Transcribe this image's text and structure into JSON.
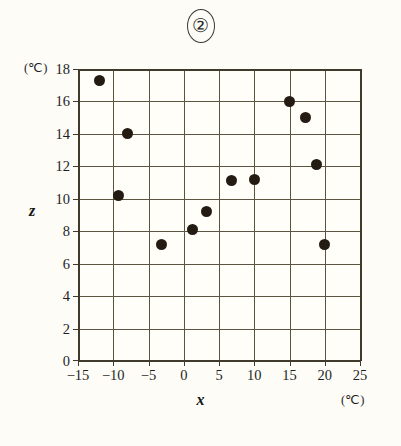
{
  "chart_data": {
    "type": "scatter",
    "title": "②",
    "xlabel": "x",
    "ylabel": "z",
    "x_unit": "(℃)",
    "y_unit": "(℃)",
    "xlim": [
      -15,
      25
    ],
    "ylim": [
      0,
      18
    ],
    "x_ticks": [
      -15,
      -10,
      -5,
      0,
      5,
      10,
      15,
      20,
      25
    ],
    "x_tick_labels": [
      "−15",
      "−10",
      "−5",
      "0",
      "5",
      "10",
      "15",
      "20",
      "25"
    ],
    "y_ticks": [
      0,
      2,
      4,
      6,
      8,
      10,
      12,
      14,
      16,
      18
    ],
    "y_tick_labels": [
      "0",
      "2",
      "4",
      "6",
      "8",
      "10",
      "12",
      "14",
      "16",
      "18"
    ],
    "grid": true,
    "legend": "none",
    "marker_color": "#241c12",
    "grid_color": "#5a5440",
    "frame_color": "#3f3a2c",
    "background_color": "#fdfcf7",
    "points": [
      {
        "x": -12.0,
        "y": 17.3
      },
      {
        "x": -9.3,
        "y": 10.2
      },
      {
        "x": -8.0,
        "y": 14.0
      },
      {
        "x": -3.1,
        "y": 7.2
      },
      {
        "x": 1.3,
        "y": 8.1
      },
      {
        "x": 3.2,
        "y": 9.2
      },
      {
        "x": 6.8,
        "y": 11.1
      },
      {
        "x": 10.1,
        "y": 11.2
      },
      {
        "x": 15.0,
        "y": 16.0
      },
      {
        "x": 17.2,
        "y": 15.0
      },
      {
        "x": 18.8,
        "y": 12.1
      },
      {
        "x": 20.0,
        "y": 7.2
      }
    ]
  }
}
